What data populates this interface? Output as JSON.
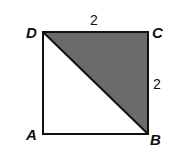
{
  "figure": {
    "type": "square with shaded triangle",
    "vertices": {
      "A": {
        "label": "A"
      },
      "B": {
        "label": "B"
      },
      "C": {
        "label": "C"
      },
      "D": {
        "label": "D"
      }
    },
    "side_labels": {
      "DC": "2",
      "CB": "2"
    },
    "diagonal": "DB",
    "shaded_region": "triangle DCB",
    "colors": {
      "shade": "#6b6b6b",
      "stroke": "#111111",
      "background": "#ffffff"
    }
  }
}
